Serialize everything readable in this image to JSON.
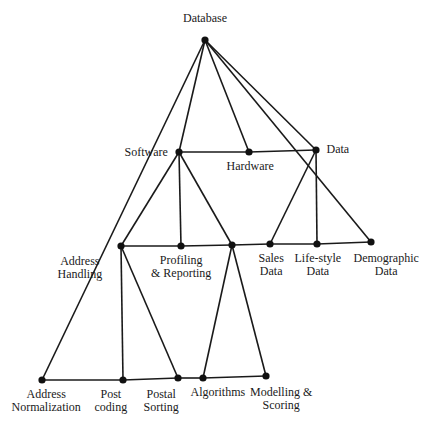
{
  "diagram": {
    "nodes": [
      {
        "id": "database",
        "label": [
          "Database"
        ],
        "x": 205,
        "y": 40,
        "lx": 205,
        "ly": 12,
        "align": "center"
      },
      {
        "id": "software",
        "label": [
          "Software"
        ],
        "x": 179,
        "y": 152,
        "lx": 146,
        "ly": 146,
        "align": "center"
      },
      {
        "id": "hardware",
        "label": [
          "Hardware"
        ],
        "x": 249,
        "y": 152,
        "lx": 250,
        "ly": 160,
        "align": "center"
      },
      {
        "id": "data",
        "label": [
          "Data"
        ],
        "x": 316,
        "y": 150,
        "lx": 338,
        "ly": 143,
        "align": "center"
      },
      {
        "id": "address_handling",
        "label": [
          "Address",
          "Handling"
        ],
        "x": 121,
        "y": 246,
        "lx": 80,
        "ly": 255,
        "align": "center"
      },
      {
        "id": "profiling",
        "label": [
          "Profiling",
          "& Reporting"
        ],
        "x": 181,
        "y": 246,
        "lx": 181,
        "ly": 254,
        "align": "center"
      },
      {
        "id": "algo_junction",
        "label": [],
        "x": 232,
        "y": 245
      },
      {
        "id": "sales",
        "label": [
          "Sales",
          "Data"
        ],
        "x": 270,
        "y": 244,
        "lx": 271,
        "ly": 252,
        "align": "center"
      },
      {
        "id": "lifestyle",
        "label": [
          "Life-style",
          "Data"
        ],
        "x": 317,
        "y": 244,
        "lx": 318,
        "ly": 252,
        "align": "center"
      },
      {
        "id": "demographic",
        "label": [
          "Demographic",
          "Data"
        ],
        "x": 371,
        "y": 242,
        "lx": 386,
        "ly": 252,
        "align": "center"
      },
      {
        "id": "address_norm",
        "label": [
          "Address",
          "Normalization"
        ],
        "x": 42,
        "y": 380,
        "lx": 46,
        "ly": 388,
        "align": "center"
      },
      {
        "id": "post_coding",
        "label": [
          "Post",
          "coding"
        ],
        "x": 123,
        "y": 380,
        "lx": 111,
        "ly": 388,
        "align": "center"
      },
      {
        "id": "postal_sorting",
        "label": [
          "Postal",
          "Sorting"
        ],
        "x": 178,
        "y": 378,
        "lx": 161,
        "ly": 388,
        "align": "center"
      },
      {
        "id": "algorithms",
        "label": [
          "Algorithms"
        ],
        "x": 203,
        "y": 378,
        "lx": 218,
        "ly": 386,
        "align": "center"
      },
      {
        "id": "modelling",
        "label": [
          "Modelling &",
          "Scoring"
        ],
        "x": 266,
        "y": 376,
        "lx": 281,
        "ly": 386,
        "align": "center"
      }
    ],
    "edges": [
      [
        "database",
        "software"
      ],
      [
        "database",
        "hardware"
      ],
      [
        "database",
        "data"
      ],
      [
        "software",
        "hardware"
      ],
      [
        "hardware",
        "data"
      ],
      [
        "database",
        "address_norm"
      ],
      [
        "database",
        "demographic"
      ],
      [
        "software",
        "address_handling"
      ],
      [
        "software",
        "profiling"
      ],
      [
        "software",
        "algo_junction"
      ],
      [
        "address_handling",
        "profiling"
      ],
      [
        "profiling",
        "algo_junction"
      ],
      [
        "algo_junction",
        "sales"
      ],
      [
        "sales",
        "lifestyle"
      ],
      [
        "lifestyle",
        "demographic"
      ],
      [
        "data",
        "sales"
      ],
      [
        "data",
        "lifestyle"
      ],
      [
        "address_handling",
        "post_coding"
      ],
      [
        "address_handling",
        "postal_sorting"
      ],
      [
        "algo_junction",
        "algorithms"
      ],
      [
        "algo_junction",
        "modelling"
      ],
      [
        "address_norm",
        "post_coding"
      ],
      [
        "post_coding",
        "postal_sorting"
      ],
      [
        "postal_sorting",
        "algorithms"
      ],
      [
        "algorithms",
        "modelling"
      ]
    ]
  }
}
